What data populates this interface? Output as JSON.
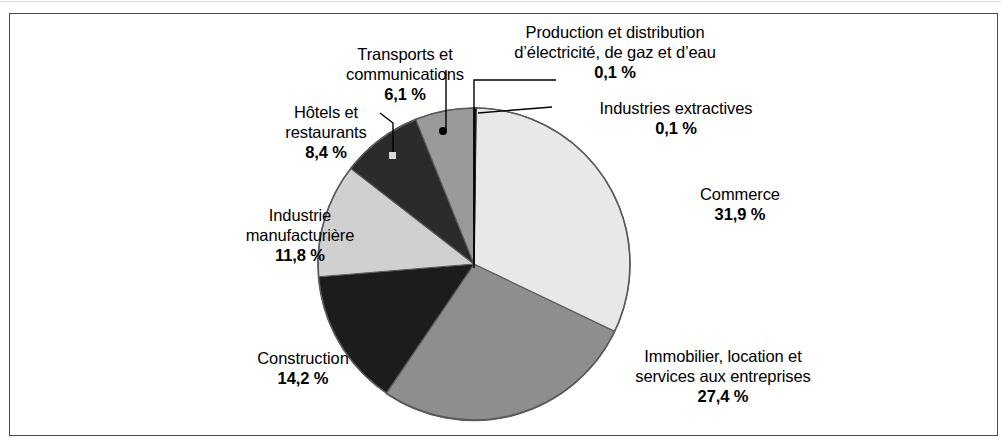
{
  "figure": {
    "background_color": "#ffffff",
    "frame_color": "#4a4a4a"
  },
  "chart_data": {
    "type": "pie",
    "title": "",
    "subtitle": "",
    "xlabel": "",
    "ylabel": "",
    "units": "%",
    "decimal_separator": ",",
    "legend": "none (direct labels with leader lines)",
    "start_angle_deg": 0,
    "direction": "clockwise",
    "total": 100.0,
    "categories": [
      "Production et distribution d’électricité, de gaz et d’eau",
      "Industries extractives",
      "Commerce",
      "Immobilier, location et services aux entreprises",
      "Construction",
      "Industrie manufacturière",
      "Hôtels et restaurants",
      "Transports et communications"
    ],
    "values": [
      0.1,
      0.1,
      31.9,
      27.4,
      14.2,
      11.8,
      8.4,
      6.1
    ],
    "value_labels": [
      "0,1 %",
      "0,1 %",
      "31,9 %",
      "27,4 %",
      "14,2 %",
      "11,8 %",
      "8,4 %",
      "6,1 %"
    ],
    "slice_colors": [
      "#1c1c1c",
      "#1c1c1c",
      "#e8e8e8",
      "#8e8e8e",
      "#1c1c1c",
      "#d0d0d0",
      "#2b2b2b",
      "#9a9a9a"
    ],
    "slices": [
      {
        "name": "production-electricite-gaz-eau",
        "label": "Production et distribution",
        "label_line2": "d’électricité, de gaz et d’eau",
        "value_label": "0,1 %",
        "value": 0.1,
        "color": "#1c1c1c"
      },
      {
        "name": "industries-extractives",
        "label": "Industries extractives",
        "label_line2": "",
        "value_label": "0,1 %",
        "value": 0.1,
        "color": "#1c1c1c"
      },
      {
        "name": "commerce",
        "label": "Commerce",
        "label_line2": "",
        "value_label": "31,9 %",
        "value": 31.9,
        "color": "#e8e8e8"
      },
      {
        "name": "immobilier-location-services-entreprises",
        "label": "Immobilier, location et",
        "label_line2": "services aux entreprises",
        "value_label": "27,4 %",
        "value": 27.4,
        "color": "#8e8e8e"
      },
      {
        "name": "construction",
        "label": "Construction",
        "label_line2": "",
        "value_label": "14,2 %",
        "value": 14.2,
        "color": "#1c1c1c"
      },
      {
        "name": "industrie-manufacturiere",
        "label": "Industrie",
        "label_line2": "manufacturière",
        "value_label": "11,8 %",
        "value": 11.8,
        "color": "#d0d0d0"
      },
      {
        "name": "hotels-restaurants",
        "label": "Hôtels et",
        "label_line2": "restaurants",
        "value_label": "8,4 %",
        "value": 8.4,
        "color": "#2b2b2b"
      },
      {
        "name": "transports-communications",
        "label": "Transports et",
        "label_line2": "communications",
        "value_label": "6,1 %",
        "value": 6.1,
        "color": "#9a9a9a"
      }
    ]
  }
}
